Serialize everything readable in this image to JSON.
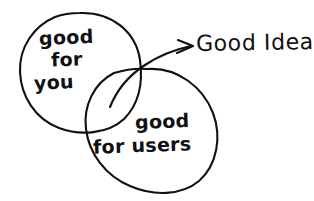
{
  "diagram": {
    "type": "venn-diagram",
    "style": "hand-drawn sketch",
    "background_color": "#ffffff",
    "stroke_color": "#111111",
    "sets": [
      {
        "id": "left",
        "name": "good-for-you",
        "lines": [
          "good",
          "for",
          "you"
        ],
        "full_label": "good for you"
      },
      {
        "id": "right",
        "name": "good-for-users",
        "lines": [
          "good",
          "for users"
        ],
        "full_label": "good for users"
      }
    ],
    "intersection": {
      "name": "good-idea",
      "callout_label": "Good Idea",
      "arrow": "curved arrow pointing right"
    }
  }
}
